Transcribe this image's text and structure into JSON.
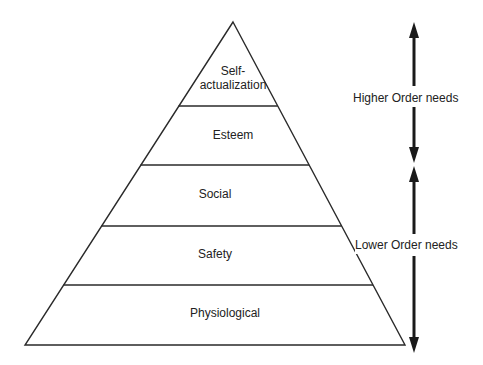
{
  "diagram": {
    "type": "pyramid",
    "levels": [
      {
        "label": "Self-\nactualization",
        "line1": "Self-",
        "line2": "actualization"
      },
      {
        "label": "Esteem"
      },
      {
        "label": "Social"
      },
      {
        "label": "Safety"
      },
      {
        "label": "Physiological"
      }
    ],
    "groups": {
      "higher": {
        "label": "Higher Order needs",
        "covers": [
          "Self-actualization",
          "Esteem"
        ]
      },
      "lower": {
        "label": "Lower Order needs",
        "covers": [
          "Social",
          "Safety",
          "Physiological"
        ]
      }
    },
    "colors": {
      "line": "#2a2a2a",
      "background": "#ffffff",
      "text": "#222222"
    }
  }
}
